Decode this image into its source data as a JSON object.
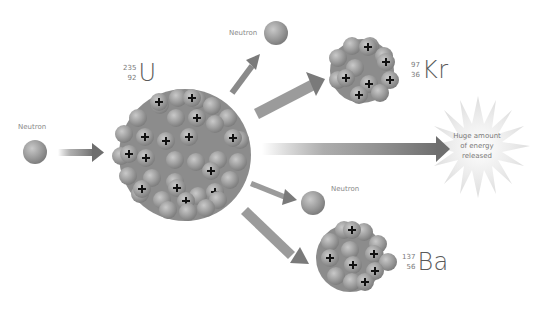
{
  "diagram": {
    "type": "nuclear-fission",
    "labels": {
      "incoming_neutron": "Neutron",
      "emitted_neutron_top": "Neutron",
      "emitted_neutron_bottom": "Neutron",
      "energy": [
        "Huge amount",
        "of energy",
        "released"
      ]
    },
    "isotopes": {
      "uranium": {
        "mass": "235",
        "atomic": "92",
        "symbol": "U"
      },
      "krypton": {
        "mass": "97",
        "atomic": "36",
        "symbol": "Kr"
      },
      "barium": {
        "mass": "137",
        "atomic": "56",
        "symbol": "Ba"
      }
    },
    "colors": {
      "nucleon": "#9a9a9a",
      "arrow": "#7a7a7a",
      "plus": "#111111",
      "starburst": "#e6e6e6"
    }
  }
}
